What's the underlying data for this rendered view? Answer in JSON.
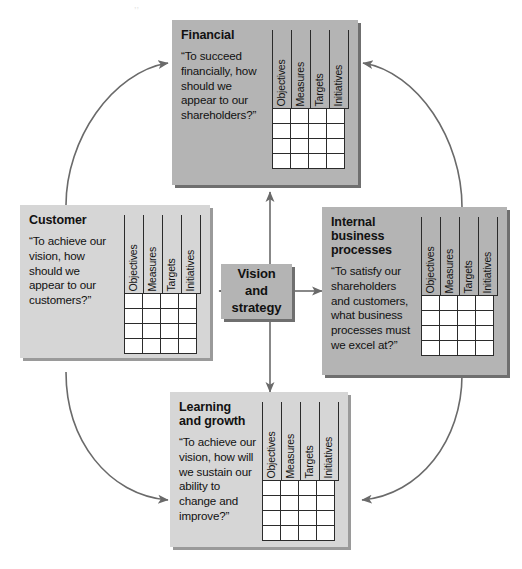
{
  "diagram": {
    "colors": {
      "panel_dark": "#b4b4b4",
      "panel_light": "#d6d6d6",
      "shadow_dark": "#6f6f6f",
      "shadow_light": "#9a9a9a",
      "cell_fill": "#ffffff",
      "line": "#2b2b2b",
      "arrow": "#6a6a6a",
      "text": "#111111",
      "background": "#ffffff"
    },
    "scorecard_columns": [
      "Objectives",
      "Measures",
      "Targets",
      "Initiatives"
    ],
    "scorecard_rows": 4,
    "center": {
      "label": "Vision\nand\nstrategy"
    },
    "panels": [
      {
        "id": "financial",
        "title": "Financial",
        "quote": "“To succeed\nfinancially, how\nshould we\nappear to our\nshareholders?”",
        "columns": [
          "Objectives",
          "Measures",
          "Targets",
          "Initiatives"
        ]
      },
      {
        "id": "customer",
        "title": "Customer",
        "quote": "“To achieve our\nvision, how\nshould we\nappear to our\ncustomers?”",
        "columns": [
          "Objectives",
          "Measures",
          "Targets",
          "Initiatives"
        ]
      },
      {
        "id": "internal-business-processes",
        "title": "Internal business\nprocesses",
        "quote": "“To satisfy our\nshareholders\nand customers,\nwhat business\nprocesses must\nwe excel at?”",
        "columns": [
          "Objectives",
          "Measures",
          "Targets",
          "Initiatives"
        ]
      },
      {
        "id": "learning-and-growth",
        "title": "Learning and\ngrowth",
        "quote": "“To achieve our\nvision, how will\nwe sustain our\nability to\nchange and\nimprove?”",
        "columns": [
          "Objectives",
          "Measures",
          "Targets",
          "Initiatives"
        ]
      }
    ],
    "connections": [
      {
        "from": "customer",
        "to": "financial",
        "style": "curved"
      },
      {
        "from": "internal-business-processes",
        "to": "financial",
        "style": "curved"
      },
      {
        "from": "customer",
        "to": "learning-and-growth",
        "style": "curved"
      },
      {
        "from": "internal-business-processes",
        "to": "learning-and-growth",
        "style": "curved"
      },
      {
        "from": "center",
        "to": "financial",
        "style": "straight"
      },
      {
        "from": "center",
        "to": "customer",
        "style": "straight"
      },
      {
        "from": "center",
        "to": "internal-business-processes",
        "style": "straight"
      },
      {
        "from": "center",
        "to": "learning-and-growth",
        "style": "straight"
      }
    ]
  }
}
